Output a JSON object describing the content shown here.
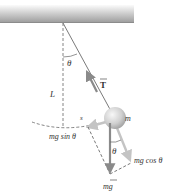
{
  "diagram": {
    "type": "pendulum-free-body-diagram",
    "labels": {
      "angle_top": "θ",
      "length": "L",
      "tension": "T",
      "arc_length": "s",
      "mass": "m",
      "tangential_component": "mg sin θ",
      "radial_component": "mg cos θ",
      "angle_bottom": "θ",
      "gravity": "mg"
    },
    "colors": {
      "ceiling_dark": "#9a9a9a",
      "ceiling_light": "#f4f4f4",
      "string": "#7a7a7a",
      "arrow": "#8a8a8a",
      "arrow_light": "#c8c8c8",
      "sphere_light": "#f2f2f2",
      "sphere_dark": "#a8a8a8",
      "dashed": "#666666",
      "text": "#333333"
    }
  }
}
